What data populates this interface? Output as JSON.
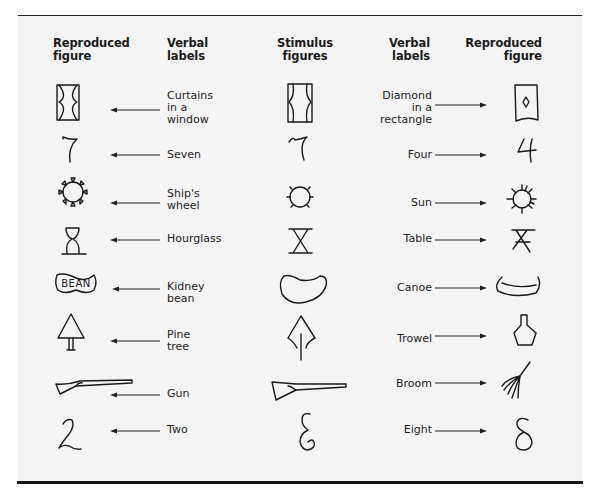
{
  "headers": {
    "left_reproduced": "Reproduced figure",
    "left_verbal": "Verbal labels",
    "stimulus": "Stimulus figures",
    "right_verbal": "Verbal labels",
    "right_reproduced": "Reproduced figure"
  },
  "headers_lines": {
    "left_reproduced": [
      "Reproduced",
      "figure"
    ],
    "left_verbal": [
      "Verbal",
      "labels"
    ],
    "stimulus": [
      "Stimulus",
      "figures"
    ],
    "right_verbal": [
      "Verbal",
      "labels"
    ],
    "right_reproduced": [
      "Reproduced",
      "figure"
    ]
  },
  "rows": [
    {
      "stimulus": "curtains-diamond-rectangle",
      "left_label": [
        "Curtains",
        "in a",
        "window"
      ],
      "left_figure": "curtains-in-window",
      "right_label": [
        "Diamond",
        "in a",
        "rectangle"
      ],
      "right_figure": "diamond-in-rectangle"
    },
    {
      "stimulus": "seven-four-ambiguous",
      "left_label": [
        "Seven"
      ],
      "left_figure": "seven",
      "right_label": [
        "Four"
      ],
      "right_figure": "four"
    },
    {
      "stimulus": "circle-with-ticks",
      "left_label": [
        "Ship's",
        "wheel"
      ],
      "left_figure": "ships-wheel",
      "right_label": [
        "Sun"
      ],
      "right_figure": "sun"
    },
    {
      "stimulus": "hourglass-table",
      "left_label": [
        "Hourglass"
      ],
      "left_figure": "hourglass",
      "right_label": [
        "Table"
      ],
      "right_figure": "table"
    },
    {
      "stimulus": "bean-canoe",
      "left_label": [
        "Kidney",
        "bean"
      ],
      "left_figure": "kidney-bean-with-text",
      "left_figure_text": "BEAN",
      "right_label": [
        "Canoe"
      ],
      "right_figure": "canoe"
    },
    {
      "stimulus": "tree-trowel",
      "left_label": [
        "Pine",
        "tree"
      ],
      "left_figure": "pine-tree",
      "right_label": [
        "Trowel"
      ],
      "right_figure": "trowel"
    },
    {
      "stimulus": "gun-broom",
      "left_label": [
        "Gun"
      ],
      "left_figure": "gun",
      "right_label": [
        "Broom"
      ],
      "right_figure": "broom"
    },
    {
      "stimulus": "two-eight-ambiguous",
      "left_label": [
        "Two"
      ],
      "left_figure": "two",
      "right_label": [
        "Eight"
      ],
      "right_figure": "eight"
    }
  ]
}
